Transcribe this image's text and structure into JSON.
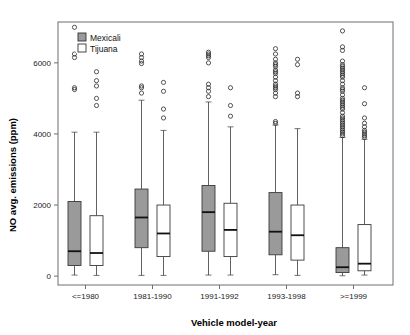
{
  "chart_data": {
    "type": "box",
    "title": "",
    "xlabel": "Vehicle model-year",
    "ylabel": "NO avg. emissions (ppm)",
    "categories": [
      "<=1980",
      "1981-1990",
      "1991-1992",
      "1993-1998",
      ">=1999"
    ],
    "ytick_labels": [
      "0",
      "2000",
      "4000",
      "6000"
    ],
    "yticks": [
      0,
      2000,
      4000,
      6000
    ],
    "ylim": [
      -250,
      7150
    ],
    "grid": false,
    "legend_position": "top-left",
    "legend": [
      "Mexicali",
      "Tijuana"
    ],
    "colors": {
      "mexicali_fill": "#9a9a9a",
      "tijuana_fill": "#ffffff",
      "line": "#3a3a3a",
      "frame": "#6e6e6e"
    },
    "series": [
      {
        "name": "Mexicali",
        "boxes": [
          {
            "category": "<=1980",
            "whisker_low": 30,
            "q1": 300,
            "median": 700,
            "q3": 2100,
            "whisker_high": 4050,
            "outliers": [
              5250,
              5300,
              6150,
              6250,
              7000
            ]
          },
          {
            "category": "1981-1990",
            "whisker_low": 20,
            "q1": 800,
            "median": 1650,
            "q3": 2450,
            "whisker_high": 4950,
            "outliers": [
              5150,
              5300,
              5350,
              5980,
              6050,
              6150,
              6250
            ]
          },
          {
            "category": "1991-1992",
            "whisker_low": 30,
            "q1": 700,
            "median": 1800,
            "q3": 2550,
            "whisker_high": 4900,
            "outliers": [
              5050,
              5200,
              5300,
              5400,
              6000,
              6150,
              6200,
              6250,
              6300
            ]
          },
          {
            "category": "1993-1998",
            "whisker_low": 40,
            "q1": 600,
            "median": 1250,
            "q3": 2350,
            "whisker_high": 4250,
            "outliers": [
              4300,
              4350,
              5050,
              5150,
              5250,
              5300,
              5350,
              5400,
              5500,
              5600,
              5700,
              5750,
              5800,
              5900,
              5950,
              6000,
              6100,
              6250,
              6400
            ]
          },
          {
            "category": ">=1999",
            "whisker_low": 10,
            "q1": 100,
            "median": 250,
            "q3": 800,
            "whisker_high": 3900,
            "outliers": [
              3950,
              4000,
              4050,
              4100,
              4150,
              4200,
              4250,
              4300,
              4350,
              4400,
              4450,
              4500,
              4600,
              4700,
              4750,
              4800,
              4850,
              4900,
              4950,
              5000,
              5100,
              5200,
              5250,
              5300,
              5400,
              5500,
              5600,
              5650,
              5700,
              5750,
              5800,
              5850,
              5900,
              5950,
              6050,
              6350,
              6450,
              6900
            ]
          }
        ]
      },
      {
        "name": "Tijuana",
        "boxes": [
          {
            "category": "<=1980",
            "whisker_low": 20,
            "q1": 300,
            "median": 650,
            "q3": 1700,
            "whisker_high": 4050,
            "outliers": [
              4800,
              5000,
              5350,
              5500,
              5750
            ]
          },
          {
            "category": "1981-1990",
            "whisker_low": 20,
            "q1": 550,
            "median": 1200,
            "q3": 2000,
            "whisker_high": 4100,
            "outliers": [
              4450,
              4700,
              5200,
              5450
            ]
          },
          {
            "category": "1991-1992",
            "whisker_low": 30,
            "q1": 550,
            "median": 1300,
            "q3": 2050,
            "whisker_high": 4200,
            "outliers": [
              4500,
              4800,
              5300
            ]
          },
          {
            "category": "1993-1998",
            "whisker_low": 20,
            "q1": 450,
            "median": 1150,
            "q3": 2000,
            "whisker_high": 4150,
            "outliers": [
              5050,
              5150,
              5950,
              6100
            ]
          },
          {
            "category": ">=1999",
            "whisker_low": 30,
            "q1": 150,
            "median": 350,
            "q3": 1450,
            "whisker_high": 3850,
            "outliers": [
              3900,
              3950,
              4000,
              4050,
              4100,
              4200,
              4300,
              4450,
              4850,
              5300
            ]
          }
        ]
      }
    ]
  }
}
